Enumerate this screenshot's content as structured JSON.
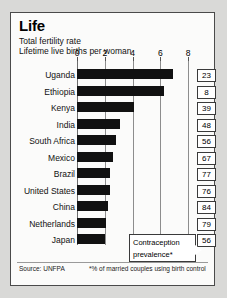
{
  "header": {
    "title": "Life",
    "subtitle1": "Total fertility rate",
    "subtitle2": "Lifetime live births per woman"
  },
  "footer": {
    "source": "Source: UNFPA",
    "note": "*% of married couples using birth control"
  },
  "callout": {
    "line1": "Contraception",
    "line2": "prevalence*"
  },
  "chart_data": {
    "type": "bar",
    "orientation": "horizontal",
    "title": "Life",
    "subtitle": "Total fertility rate — Lifetime live births per woman",
    "xlabel": "",
    "ylabel": "",
    "xlim": [
      0,
      8
    ],
    "ticks": [
      0,
      2,
      4,
      6,
      8
    ],
    "tick_labels": [
      "0",
      "2",
      "4",
      "6",
      "8"
    ],
    "grid": true,
    "legend": false,
    "bar_color": "#111111",
    "categories": [
      "Uganda",
      "Ethiopia",
      "Kenya",
      "India",
      "South Africa",
      "Mexico",
      "Brazil",
      "United States",
      "China",
      "Netherlands",
      "Japan"
    ],
    "values": [
      6.9,
      6.3,
      4.1,
      3.1,
      2.8,
      2.6,
      2.4,
      2.4,
      2.2,
      2.1,
      2.0
    ],
    "annotation_series": {
      "name": "Contraception prevalence*",
      "unit": "%",
      "values": [
        23,
        8,
        39,
        48,
        56,
        67,
        77,
        76,
        84,
        79,
        56
      ]
    }
  }
}
